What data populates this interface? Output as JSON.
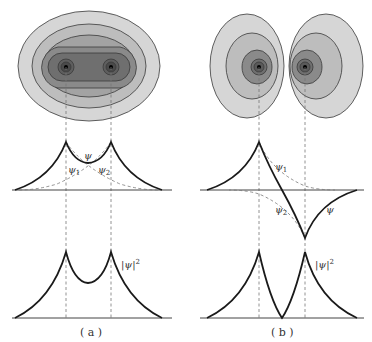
{
  "figure": {
    "panels": [
      {
        "id": "a",
        "caption": "( a )",
        "description": "Bonding orbital: symmetric combination ψ = ψ1 + ψ2",
        "contour_labels": [],
        "wave_labels": {
          "psi": "ψ",
          "psi1": "ψ1",
          "psi2": "ψ2"
        },
        "density_label": "|ψ|²"
      },
      {
        "id": "b",
        "caption": "( b )",
        "description": "Antibonding orbital: antisymmetric combination ψ = ψ1 − ψ2",
        "wave_labels": {
          "psi": "ψ",
          "psi1": "ψ1",
          "psi2": "ψ2"
        },
        "density_label": "|ψ|²"
      }
    ],
    "colors": {
      "contour_levels": [
        "#d6d6d6",
        "#bdbdbd",
        "#a3a3a3",
        "#8a8a8a",
        "#6f6f6f",
        "#555555"
      ],
      "line": "#1a1a1a",
      "dashed": "#777777",
      "axis": "#444444"
    }
  },
  "text": {
    "a_psi": "ψ",
    "a_psi1": "ψ",
    "a_psi1_sub": "1",
    "a_psi2": "ψ",
    "a_psi2_sub": "2",
    "a_density": "|ψ|",
    "a_density_sup": "2",
    "a_caption": "( a )",
    "b_psi": "ψ",
    "b_psi1": "ψ",
    "b_psi1_sub": "1",
    "b_psi2": "ψ",
    "b_psi2_sub": "2",
    "b_density": "|ψ|",
    "b_density_sup": "2",
    "b_caption": "( b )"
  }
}
